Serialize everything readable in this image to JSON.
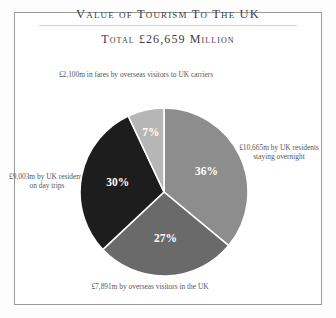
{
  "page": {
    "background_color": "#ffffff",
    "frame_color": "#9a9a9a"
  },
  "header": {
    "title": "Value of Tourism To The UK",
    "subtitle": "Total £26,659 Million"
  },
  "annotations": {
    "fares": "£2,100m in fares by overseas visitors to UK carriers",
    "overnight": "£10,665m by UK residents staying overnight",
    "day_trips": "£9,003m by UK residents on day trips",
    "overseas_in_uk": "£7,891m by overseas visitors in the UK"
  },
  "chart_data": {
    "type": "pie",
    "title": "Value of Tourism To The UK",
    "subtitle": "Total £26,659 Million",
    "total_label": "£26,659 Million",
    "total_value": 26659,
    "unit": "£ million",
    "start_angle_deg": 0,
    "direction": "clockwise",
    "legend_position": "callout-labels",
    "categories": [
      "UK residents staying overnight",
      "Overseas visitors in the UK",
      "UK residents on day trips",
      "Fares by overseas visitors to UK carriers"
    ],
    "values": [
      10665,
      7891,
      9003,
      2100
    ],
    "percentages": [
      36,
      27,
      30,
      7
    ],
    "percent_labels": [
      "36%",
      "27%",
      "30%",
      "7%"
    ],
    "value_labels": [
      "£10,665m",
      "£7,891m",
      "£9,003m",
      "£2,100m"
    ],
    "colors": [
      "#8d8d8d",
      "#6a6a6a",
      "#1d1d1d",
      "#b6b6b6"
    ],
    "slice_separator_color": "#ffffff",
    "slices": [
      {
        "name": "UK residents staying overnight",
        "percent": 36,
        "value": 10665,
        "label": "36%",
        "annotation": "£10,665m by UK residents staying overnight",
        "color": "#8d8d8d"
      },
      {
        "name": "Overseas visitors in the UK",
        "percent": 27,
        "value": 7891,
        "label": "27%",
        "annotation": "£7,891m by overseas visitors in the UK",
        "color": "#6a6a6a"
      },
      {
        "name": "UK residents on day trips",
        "percent": 30,
        "value": 9003,
        "label": "30%",
        "annotation": "£9,003m by UK residents on day trips",
        "color": "#1d1d1d"
      },
      {
        "name": "Fares by overseas visitors to UK carriers",
        "percent": 7,
        "value": 2100,
        "label": "7%",
        "annotation": "£2,100m in fares by overseas visitors to UK carriers",
        "color": "#b6b6b6"
      }
    ]
  }
}
